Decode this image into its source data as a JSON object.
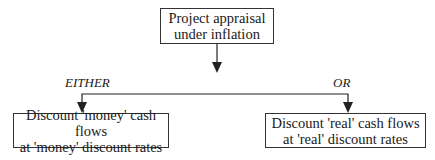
{
  "diagram": {
    "root": {
      "line1": "Project appraisal",
      "line2": "under inflation"
    },
    "branches": [
      {
        "label": "EITHER",
        "line1": "Discount 'money' cash flows",
        "line2": "at 'money' discount rates"
      },
      {
        "label": "OR",
        "line1": "Discount 'real' cash flows",
        "line2": "at 'real' discount rates"
      }
    ]
  },
  "colors": {
    "line": "#222222",
    "border": "#333333",
    "text": "#1a1a1a"
  }
}
